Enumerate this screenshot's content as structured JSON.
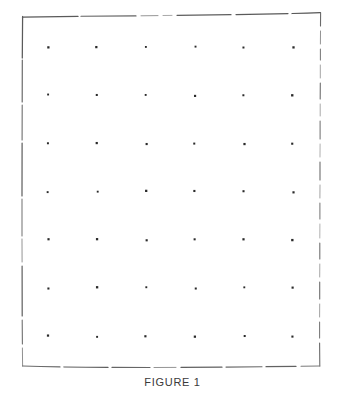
{
  "figure": {
    "caption": "FIGURE 1",
    "kind": "patent-line-drawing",
    "background_color": "#ffffff",
    "ink_color": "#4a4a4a",
    "dot_color": "#2a2a2a",
    "border": {
      "style": "hand-drawn-broken-rectangle",
      "left_x": 22,
      "right_x": 320,
      "top_y": 16,
      "bottom_y": 366,
      "stroke_width": 1.2,
      "edges": {
        "top": "solid-with-gaps",
        "right": "dashed",
        "bottom": "dashed-with-gaps",
        "left": "solid-with-gaps"
      }
    },
    "grid": {
      "columns": 6,
      "rows": 7,
      "first_dot_x": 48,
      "first_dot_y": 47,
      "column_spacing": 49,
      "row_spacing": 48.2,
      "dot_size": 2.1,
      "dot_shape": "square"
    }
  }
}
